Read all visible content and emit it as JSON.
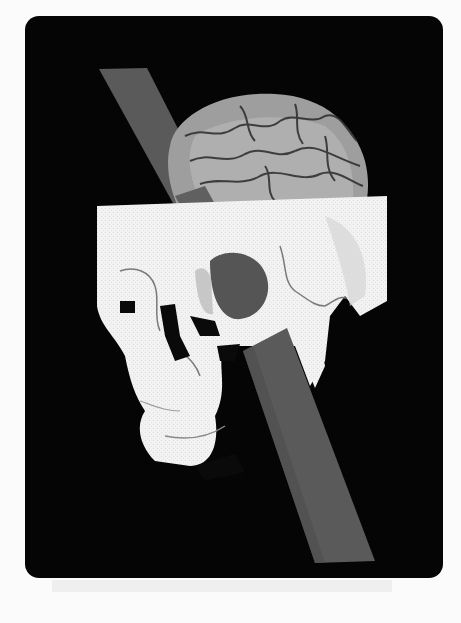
{
  "image": {
    "subject": "3D reconstruction of a human skull with exposed brain, pierced diagonally by a long iron rod",
    "frame_color": "#050505",
    "page_background": "#fbfbfb",
    "colors": {
      "rod": "#5a5a5a",
      "rod_shadow": "#474747",
      "skull": "#f2f2f2",
      "skull_shade": "#c8c8c8",
      "brain": "#9a9a9a",
      "brain_light": "#b8b8b8",
      "sulci": "#2a2a2a",
      "cavity": "#0a0a0a"
    },
    "elements": [
      "brain",
      "skull-cranium",
      "orbit-left",
      "orbit-right-with-rod",
      "nasal-cavity",
      "mandible",
      "iron-rod"
    ]
  }
}
